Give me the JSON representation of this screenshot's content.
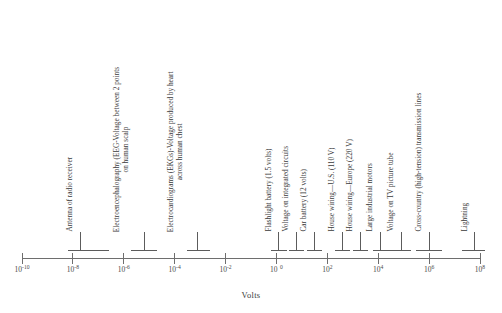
{
  "figure": {
    "axis_title": "Volts",
    "axis_color": "#6e6e6e",
    "marker_color": "#5c5c5c",
    "text_color": "#3a3a3a",
    "background": "#ffffff"
  },
  "chart_data": {
    "type": "scatter",
    "title": "",
    "subtitle": "",
    "xlabel": "Volts",
    "ylabel": "",
    "scale": "log10",
    "grid": false,
    "legend": null,
    "xlim": [
      -10,
      8
    ],
    "axis_ticks": [
      {
        "exponent": "-10",
        "base": "10",
        "label": "10⁻¹⁰",
        "value": 1e-10
      },
      {
        "exponent": "-8",
        "base": "10",
        "label": "10⁻⁸",
        "value": 1e-08
      },
      {
        "exponent": "-6",
        "base": "10",
        "label": "10⁻⁶",
        "value": 1e-06
      },
      {
        "exponent": "-4",
        "base": "10",
        "label": "10⁻⁴",
        "value": 0.0001
      },
      {
        "exponent": "-2",
        "base": "10",
        "label": "10⁻²",
        "value": 0.01
      },
      {
        "exponent": "0",
        "base": "10",
        "label": "10 0",
        "value": 1
      },
      {
        "exponent": "2",
        "base": "10",
        "label": "10²",
        "value": 100
      },
      {
        "exponent": "4",
        "base": "10",
        "label": "10⁴",
        "value": 10000
      },
      {
        "exponent": "6",
        "base": "10",
        "label": "10⁶",
        "value": 1000000
      },
      {
        "exponent": "8",
        "base": "10",
        "label": "10⁸",
        "value": 100000000
      }
    ],
    "items": [
      {
        "label": "Antenna of radio receiver",
        "lines": [
          "Antenna of radio receiver"
        ],
        "stem_exponent": -7.7,
        "range_start_exponent": -8.2,
        "range_end_exponent": -6.6
      },
      {
        "label": "Electroencephalography (EEG-Voltage between 2 points on human scalp",
        "lines": [
          "Electroencephalography (EEG-Voltage between 2 points",
          "on human scalp"
        ],
        "stem_exponent": -5.2,
        "range_start_exponent": -5.7,
        "range_end_exponent": -4.7
      },
      {
        "label": "Electrocardiograms (EKGs)-Voltage produced by heart across human chest",
        "lines": [
          "Electrocardiograms (EKGs)-Voltage produced by heart",
          "across human chest"
        ],
        "stem_exponent": -3.1,
        "range_start_exponent": -3.5,
        "range_end_exponent": -2.6
      },
      {
        "label": "Flashlight battery (1.5 volts)",
        "lines": [
          "Flashlight battery (1.5 volts)"
        ],
        "stem_exponent": 0.1,
        "range_start_exponent": -0.2,
        "range_end_exponent": 0.4
      },
      {
        "label": "Voltage on integrated circuits",
        "lines": [
          "Voltage on integrated circuits"
        ],
        "stem_exponent": 0.8,
        "range_start_exponent": 0.5,
        "range_end_exponent": 1.1
      },
      {
        "label": "Car battery (12 volts)",
        "lines": [
          "Car battery (12 volts)"
        ],
        "stem_exponent": 1.5,
        "range_start_exponent": 1.2,
        "range_end_exponent": 1.8
      },
      {
        "label": "House wiring—U.S. (110 V)",
        "lines": [
          "House wiring—U.S. (110 V)"
        ],
        "stem_exponent": 2.6,
        "range_start_exponent": 2.3,
        "range_end_exponent": 2.9
      },
      {
        "label": "House wiring—Europe (220 V)",
        "lines": [
          "House wiring—Europe (220 V)"
        ],
        "stem_exponent": 3.3,
        "range_start_exponent": 3.0,
        "range_end_exponent": 3.6
      },
      {
        "label": "Large industrial motors",
        "lines": [
          "Large industrial motors"
        ],
        "stem_exponent": 4.1,
        "range_start_exponent": 3.8,
        "range_end_exponent": 4.5
      },
      {
        "label": "Voltage on TV picture tube",
        "lines": [
          "Voltage on TV picture tube"
        ],
        "stem_exponent": 4.9,
        "range_start_exponent": 4.4,
        "range_end_exponent": 5.3
      },
      {
        "label": "Cross-country (high-tension) transmission lines",
        "lines": [
          "Cross-country (high-tension) transmission lines"
        ],
        "stem_exponent": 6.0,
        "range_start_exponent": 5.5,
        "range_end_exponent": 6.5
      },
      {
        "label": "Lightning",
        "lines": [
          "Lightning"
        ],
        "stem_exponent": 7.8,
        "range_start_exponent": 7.3,
        "range_end_exponent": 8.2
      }
    ]
  }
}
